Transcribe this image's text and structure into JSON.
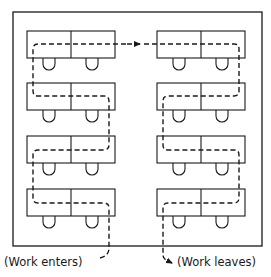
{
  "diagram": {
    "type": "office-layout-workflow",
    "colors": {
      "stroke": "#1a1a1a",
      "background": "#ffffff"
    },
    "room": {
      "x": 13,
      "y": 12,
      "width": 249,
      "height": 234
    },
    "desk_rows": [
      {
        "y": 31
      },
      {
        "y": 83
      },
      {
        "y": 136
      },
      {
        "y": 189
      }
    ],
    "desk_columns": [
      {
        "x": 27,
        "width": 88,
        "split": 44
      },
      {
        "x": 157,
        "width": 88,
        "split": 44
      }
    ],
    "desk_height": 27,
    "labels": {
      "enter": "(Work enters)",
      "leave": "(Work leaves)"
    }
  }
}
